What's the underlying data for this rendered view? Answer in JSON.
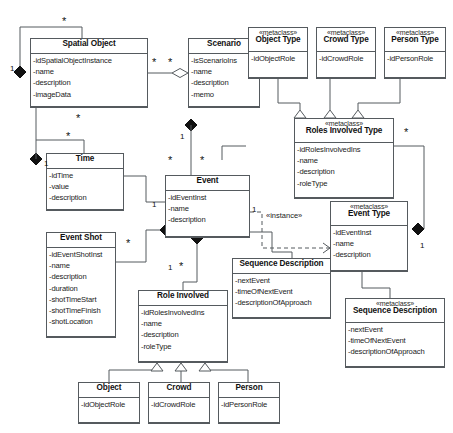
{
  "diagram": {
    "type": "uml-class-diagram",
    "stereotype_metaclass": "«metaclass»",
    "stereotype_instance": "«instance»",
    "colors": {
      "border": "#555a5e",
      "text": "#111111",
      "background": "#ffffff"
    }
  },
  "classes": [
    {
      "id": "spatial_object",
      "name": "Spatial Object",
      "stereotype": "",
      "attributes": [
        "-idSpatialObjectInstance",
        "-name",
        "-description",
        "-imageData"
      ]
    },
    {
      "id": "scenario",
      "name": "Scenario",
      "stereotype": "",
      "attributes": [
        "-isScenarioIns",
        "-name",
        "-description",
        "-memo"
      ]
    },
    {
      "id": "object_type",
      "name": "Object Type",
      "stereotype": "«metaclass»",
      "attributes": [
        "-idObjectRole"
      ]
    },
    {
      "id": "crowd_type",
      "name": "Crowd Type",
      "stereotype": "«metaclass»",
      "attributes": [
        "-idCrowdRole"
      ]
    },
    {
      "id": "person_type",
      "name": "Person Type",
      "stereotype": "«metaclass»",
      "attributes": [
        "-idPersonRole"
      ]
    },
    {
      "id": "roles_involved_type",
      "name": "Roles Involved Type",
      "stereotype": "«metaclass»",
      "attributes": [
        "-idRolesInvolvedIns",
        "-name",
        "-description",
        "-roleType"
      ]
    },
    {
      "id": "time",
      "name": "Time",
      "stereotype": "",
      "attributes": [
        "-idTime",
        "-value",
        "-description"
      ]
    },
    {
      "id": "event",
      "name": "Event",
      "stereotype": "",
      "attributes": [
        "-idEventInst",
        "-name",
        "-description"
      ]
    },
    {
      "id": "event_type",
      "name": "Event Type",
      "stereotype": "«metaclass»",
      "attributes": [
        "-idEventInst",
        "-name",
        "-description"
      ]
    },
    {
      "id": "event_shot",
      "name": "Event Shot",
      "stereotype": "",
      "attributes": [
        "-idEventShotInst",
        "-name",
        "-description",
        "-duration",
        "-shotTimeStart",
        "-shotTimeFinish",
        "-shotLocation"
      ]
    },
    {
      "id": "role_involved",
      "name": "Role Involved",
      "stereotype": "",
      "attributes": [
        "-idRolesInvolvedIns",
        "-name",
        "-description",
        "-roleType"
      ]
    },
    {
      "id": "sequence_description",
      "name": "Sequence Description",
      "stereotype": "",
      "attributes": [
        "-nextEvent",
        "-timeOfNextEvent",
        "-descriptionOfApproach"
      ]
    },
    {
      "id": "sequence_description_type",
      "name": "Sequence Description",
      "stereotype": "«metaclass»",
      "attributes": [
        "-nextEvent",
        "-timeOfNextEvent",
        "-descriptionOfApproach"
      ]
    },
    {
      "id": "object",
      "name": "Object",
      "stereotype": "",
      "attributes": [
        "-idObjectRole"
      ]
    },
    {
      "id": "crowd",
      "name": "Crowd",
      "stereotype": "",
      "attributes": [
        "-idCrowdRole"
      ]
    },
    {
      "id": "person",
      "name": "Person",
      "stereotype": "",
      "attributes": [
        "-idPersonRole"
      ]
    }
  ],
  "multiplicities": {
    "spatial_object_self_star": "*",
    "spatial_object_self_one": "1",
    "spatial_object_scenario_a": "*",
    "spatial_object_scenario_b": "*",
    "spatial_object_bottom_star": "*",
    "scenario_event_one": "1",
    "scenario_event_star": "*",
    "event_top_star": "*",
    "time_self_star": "*",
    "time_self_one": "1",
    "time_event_one": "1",
    "event_shot_star": "*",
    "event_role_one": "1",
    "event_role_star": "*",
    "event_instance_one": "1",
    "roles_involved_type_star": "*",
    "event_type_one": "1"
  },
  "edge_labels": {
    "instance": "«instance»"
  }
}
